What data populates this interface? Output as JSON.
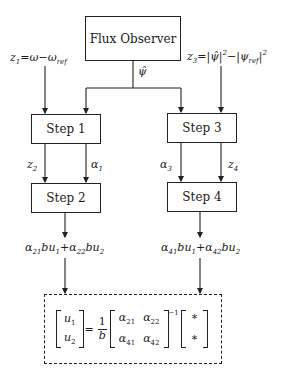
{
  "diagram": {
    "observer": {
      "label": "Flux Observer"
    },
    "observer_output": {
      "symbol": "ψ̂"
    },
    "inputs": {
      "z1": {
        "lhs": "z",
        "lhs_sub": "1",
        "eq": "=",
        "rhs1": "ω",
        "minus": "−",
        "rhs2": "ω",
        "rhs2_sub": "ref"
      },
      "z3": {
        "lhs": "z",
        "lhs_sub": "3",
        "eq": "=",
        "part1": "|ψ̂|",
        "sup1": "2",
        "minus": "−",
        "part2": "|ψ",
        "part2_sub": "ref",
        "part2_end": "|",
        "sup2": "2"
      }
    },
    "steps": [
      {
        "id": "step1",
        "label": "Step 1"
      },
      {
        "id": "step2",
        "label": "Step 2"
      },
      {
        "id": "step3",
        "label": "Step 3"
      },
      {
        "id": "step4",
        "label": "Step 4"
      }
    ],
    "edge_labels": {
      "z2": {
        "base": "z",
        "sub": "2"
      },
      "alpha1": {
        "base": "α",
        "sub": "1"
      },
      "alpha3": {
        "base": "α",
        "sub": "3"
      },
      "z4": {
        "base": "z",
        "sub": "4"
      }
    },
    "outputs": {
      "left": {
        "a": "α",
        "a_sub": "21",
        "t1": "bu",
        "t1_sub": "1",
        "plus": "+",
        "b": "α",
        "b_sub": "22",
        "t2": "bu",
        "t2_sub": "2"
      },
      "right": {
        "a": "α",
        "a_sub": "41",
        "t1": "bu",
        "t1_sub": "1",
        "plus": "+",
        "b": "α",
        "b_sub": "42",
        "t2": "bu",
        "t2_sub": "2"
      }
    },
    "control_law": {
      "u1": "u",
      "u1_sub": "1",
      "u2": "u",
      "u2_sub": "2",
      "eq": "=",
      "frac_num": "1",
      "frac_den": "b",
      "m11": "α",
      "m11_sub": "21",
      "m12": "α",
      "m12_sub": "22",
      "m21": "α",
      "m21_sub": "41",
      "m22": "α",
      "m22_sub": "42",
      "inv_exp": "−1",
      "rhs_top": "*",
      "rhs_bottom": "*"
    }
  }
}
